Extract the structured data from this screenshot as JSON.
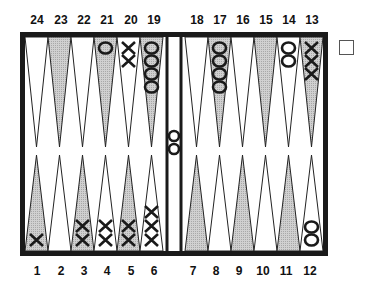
{
  "board": {
    "top_labels": [
      "24",
      "23",
      "22",
      "21",
      "20",
      "19",
      "18",
      "17",
      "16",
      "15",
      "14",
      "13"
    ],
    "bottom_labels": [
      "1",
      "2",
      "3",
      "4",
      "5",
      "6",
      "7",
      "8",
      "9",
      "10",
      "11",
      "12"
    ],
    "colors": {
      "frame": "#1a1a1a",
      "shaded_point": "#c8c8c8",
      "light_point": "#ffffff",
      "checker_stroke": "#1a1a1a"
    },
    "points": [
      {
        "point": 24,
        "player": "",
        "count": 0
      },
      {
        "point": 23,
        "player": "",
        "count": 0
      },
      {
        "point": 22,
        "player": "",
        "count": 0
      },
      {
        "point": 21,
        "player": "O",
        "count": 1
      },
      {
        "point": 20,
        "player": "X",
        "count": 2
      },
      {
        "point": 19,
        "player": "O",
        "count": 4
      },
      {
        "point": 18,
        "player": "",
        "count": 0
      },
      {
        "point": 17,
        "player": "O",
        "count": 4
      },
      {
        "point": 16,
        "player": "",
        "count": 0
      },
      {
        "point": 15,
        "player": "",
        "count": 0
      },
      {
        "point": 14,
        "player": "O",
        "count": 2
      },
      {
        "point": 13,
        "player": "X",
        "count": 3
      },
      {
        "point": 1,
        "player": "X",
        "count": 1
      },
      {
        "point": 2,
        "player": "",
        "count": 0
      },
      {
        "point": 3,
        "player": "X",
        "count": 2
      },
      {
        "point": 4,
        "player": "X",
        "count": 2
      },
      {
        "point": 5,
        "player": "X",
        "count": 2
      },
      {
        "point": 6,
        "player": "X",
        "count": 3
      },
      {
        "point": 7,
        "player": "",
        "count": 0
      },
      {
        "point": 8,
        "player": "",
        "count": 0
      },
      {
        "point": 9,
        "player": "",
        "count": 0
      },
      {
        "point": 10,
        "player": "",
        "count": 0
      },
      {
        "point": 11,
        "player": "",
        "count": 0
      },
      {
        "point": 12,
        "player": "O",
        "count": 2
      }
    ],
    "bar": {
      "player": "O",
      "count": 2
    },
    "doubling_cube": {
      "value": ""
    }
  }
}
